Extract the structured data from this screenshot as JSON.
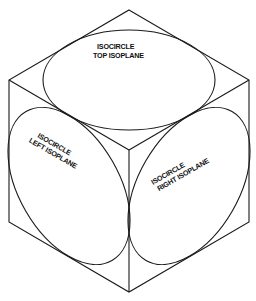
{
  "diagram": {
    "type": "isometric-cube-with-isocircles",
    "colors": {
      "line": "#1a1a1a",
      "text": "#111111",
      "background": "#ffffff"
    },
    "cube": {
      "vertices": {
        "top": [
          129,
          10
        ],
        "upper_left": [
          9,
          80
        ],
        "upper_right": [
          249,
          80
        ],
        "center": [
          129,
          150
        ],
        "lower_left": [
          9,
          222
        ],
        "lower_right": [
          249,
          222
        ],
        "bottom": [
          129,
          292
        ]
      }
    },
    "isocircles": [
      {
        "id": "top",
        "label_line1": "ISOCIRCLE",
        "label_line2": "TOP ISOPLANE"
      },
      {
        "id": "left",
        "label_line1": "ISOCIRCLE",
        "label_line2": "LEFT ISOPLANE"
      },
      {
        "id": "right",
        "label_line1": "ISOCIRCLE",
        "label_line2": "RIGHT ISOPLANE"
      }
    ]
  }
}
